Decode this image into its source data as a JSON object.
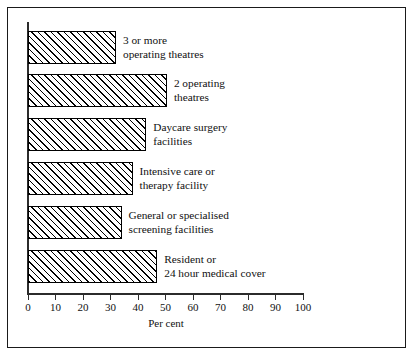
{
  "figure": {
    "frame_color": "#1a1a1a",
    "background": "#ffffff"
  },
  "chart_data": {
    "type": "bar",
    "orientation": "horizontal",
    "title": "",
    "xlabel": "Per cent",
    "ylabel": "",
    "xlim": [
      0,
      100
    ],
    "xticks": [
      0,
      10,
      20,
      30,
      40,
      50,
      60,
      70,
      80,
      90,
      100
    ],
    "xtick_labels": [
      "0",
      "10",
      "20",
      "30",
      "40",
      "50",
      "60",
      "70",
      "80",
      "90",
      "100"
    ],
    "grid": false,
    "legend": null,
    "bar_fill": "diagonal-hatch",
    "bar_edge_color": "#000000",
    "categories": [
      "3 or more operating theatres",
      "2 operating theatres",
      "Daycare surgery facilities",
      "Intensive care or therapy facility",
      "General or specialised screening facilities",
      "Resident or 24 hour medical cover"
    ],
    "values": [
      32,
      50.5,
      43,
      38,
      34,
      47
    ]
  },
  "bars": [
    {
      "label_line1": "3 or more",
      "label_line2": "operating theatres",
      "value": 32
    },
    {
      "label_line1": "2 operating",
      "label_line2": "theatres",
      "value": 50.5
    },
    {
      "label_line1": "Daycare surgery",
      "label_line2": "facilities",
      "value": 43
    },
    {
      "label_line1": "Intensive care or",
      "label_line2": "therapy facility",
      "value": 38
    },
    {
      "label_line1": "General or specialised",
      "label_line2": "screening facilities",
      "value": 34
    },
    {
      "label_line1": "Resident or",
      "label_line2": "24 hour medical cover",
      "value": 47
    }
  ],
  "axis": {
    "title": "Per cent",
    "ticks": [
      {
        "label": "0"
      },
      {
        "label": "10"
      },
      {
        "label": "20"
      },
      {
        "label": "30"
      },
      {
        "label": "40"
      },
      {
        "label": "50"
      },
      {
        "label": "60"
      },
      {
        "label": "70"
      },
      {
        "label": "80"
      },
      {
        "label": "90"
      },
      {
        "label": "100"
      }
    ]
  }
}
